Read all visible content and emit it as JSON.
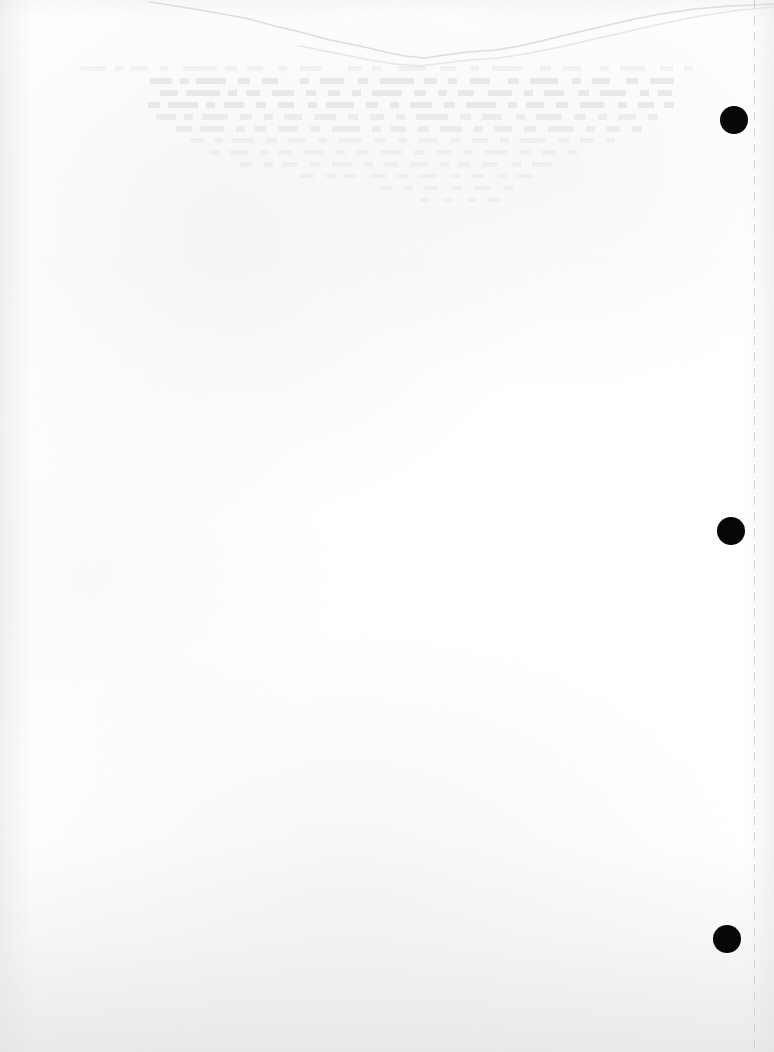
{
  "page": {
    "kind": "scanned-document-page",
    "width": 774,
    "height": 1052,
    "background_color": "#ffffff",
    "content_text": "",
    "note": "Near-blank scanned sheet: no legible printed text."
  },
  "artifacts": {
    "crease": {
      "name": "top-fold-crease",
      "color": "#d9dbdd",
      "description": "Faint irregular wavy line crossing the upper edge of the sheet",
      "path": "M 150 2 L 200 10 L 245 18 L 275 26 L 300 32 L 330 40 L 360 46 L 385 52 L 405 56 L 425 58 L 445 55 L 468 52 L 495 50 L 520 46 L 545 40 L 570 34 L 600 27 L 630 20 L 660 14 L 695 9 L 730 6 L 774 4",
      "path_shadow": "M 300 46 L 340 54 L 370 60 L 395 64 L 420 66 L 445 63 L 470 60 L 500 58 L 530 53 L 560 47 L 595 39 L 630 31 L 665 23 L 700 16 L 740 10 L 774 7"
    },
    "ghost_text": {
      "name": "bleed-through-ghost-text",
      "color": "#8c9298",
      "legible": false,
      "description": "Illegible mirrored bleed-through of text printed on the reverse side, visible in the upper third"
    },
    "guide_line": {
      "name": "right-margin-dashed-line",
      "color": "#cdd0d3",
      "x": 754,
      "style": "dashed"
    }
  },
  "registration_dots": {
    "name": "registration-dots",
    "color": "#070707",
    "count": 3,
    "items": [
      {
        "label": "dot-1",
        "cx": 734,
        "cy": 120,
        "d": 28
      },
      {
        "label": "dot-2",
        "cx": 731,
        "cy": 531,
        "d": 28
      },
      {
        "label": "dot-3",
        "cx": 727,
        "cy": 939,
        "d": 28
      }
    ]
  },
  "ghost_rows": [
    {
      "top": 66,
      "segs": [
        [
          80,
          26
        ],
        [
          115,
          9
        ],
        [
          130,
          18
        ],
        [
          160,
          8
        ],
        [
          183,
          34
        ],
        [
          225,
          12
        ],
        [
          247,
          16
        ],
        [
          278,
          9
        ],
        [
          300,
          22
        ],
        [
          348,
          14
        ],
        [
          372,
          10
        ],
        [
          398,
          28
        ],
        [
          440,
          16
        ],
        [
          470,
          9
        ],
        [
          492,
          30
        ],
        [
          540,
          11
        ],
        [
          562,
          20
        ],
        [
          600,
          9
        ],
        [
          620,
          26
        ],
        [
          660,
          13
        ],
        [
          684,
          9
        ]
      ],
      "h": 5,
      "cls": "l3"
    },
    {
      "top": 78,
      "segs": [
        [
          150,
          22
        ],
        [
          180,
          9
        ],
        [
          196,
          30
        ],
        [
          238,
          12
        ],
        [
          262,
          16
        ],
        [
          300,
          9
        ],
        [
          320,
          24
        ],
        [
          358,
          10
        ],
        [
          380,
          34
        ],
        [
          424,
          13
        ],
        [
          448,
          9
        ],
        [
          470,
          20
        ],
        [
          508,
          11
        ],
        [
          530,
          28
        ],
        [
          572,
          9
        ],
        [
          592,
          18
        ],
        [
          626,
          12
        ],
        [
          650,
          24
        ]
      ],
      "h": 6,
      "cls": ""
    },
    {
      "top": 90,
      "segs": [
        [
          160,
          18
        ],
        [
          186,
          34
        ],
        [
          228,
          9
        ],
        [
          246,
          14
        ],
        [
          272,
          22
        ],
        [
          306,
          10
        ],
        [
          328,
          12
        ],
        [
          352,
          9
        ],
        [
          372,
          30
        ],
        [
          414,
          12
        ],
        [
          438,
          9
        ],
        [
          458,
          16
        ],
        [
          488,
          24
        ],
        [
          524,
          9
        ],
        [
          544,
          20
        ],
        [
          578,
          11
        ],
        [
          600,
          26
        ],
        [
          640,
          9
        ],
        [
          658,
          14
        ]
      ],
      "h": 6,
      "cls": ""
    },
    {
      "top": 102,
      "segs": [
        [
          148,
          12
        ],
        [
          168,
          30
        ],
        [
          206,
          9
        ],
        [
          224,
          20
        ],
        [
          256,
          10
        ],
        [
          278,
          16
        ],
        [
          308,
          9
        ],
        [
          326,
          28
        ],
        [
          366,
          12
        ],
        [
          390,
          9
        ],
        [
          410,
          22
        ],
        [
          444,
          11
        ],
        [
          466,
          30
        ],
        [
          508,
          9
        ],
        [
          526,
          18
        ],
        [
          556,
          12
        ],
        [
          580,
          24
        ],
        [
          618,
          9
        ],
        [
          638,
          16
        ],
        [
          664,
          10
        ]
      ],
      "h": 6,
      "cls": ""
    },
    {
      "top": 114,
      "segs": [
        [
          156,
          20
        ],
        [
          184,
          9
        ],
        [
          202,
          26
        ],
        [
          240,
          12
        ],
        [
          264,
          9
        ],
        [
          284,
          18
        ],
        [
          314,
          22
        ],
        [
          348,
          10
        ],
        [
          370,
          14
        ],
        [
          396,
          9
        ],
        [
          416,
          32
        ],
        [
          460,
          11
        ],
        [
          482,
          20
        ],
        [
          516,
          9
        ],
        [
          536,
          26
        ],
        [
          574,
          12
        ],
        [
          598,
          9
        ],
        [
          618,
          18
        ],
        [
          648,
          10
        ]
      ],
      "h": 6,
      "cls": "l2"
    },
    {
      "top": 126,
      "segs": [
        [
          176,
          16
        ],
        [
          200,
          24
        ],
        [
          236,
          9
        ],
        [
          254,
          12
        ],
        [
          278,
          20
        ],
        [
          310,
          10
        ],
        [
          332,
          28
        ],
        [
          372,
          9
        ],
        [
          390,
          16
        ],
        [
          418,
          11
        ],
        [
          440,
          22
        ],
        [
          474,
          9
        ],
        [
          494,
          18
        ],
        [
          524,
          12
        ],
        [
          548,
          26
        ],
        [
          586,
          9
        ],
        [
          606,
          14
        ],
        [
          632,
          10
        ]
      ],
      "h": 6,
      "cls": "l2"
    },
    {
      "top": 138,
      "segs": [
        [
          190,
          14
        ],
        [
          214,
          9
        ],
        [
          232,
          22
        ],
        [
          266,
          11
        ],
        [
          288,
          18
        ],
        [
          318,
          9
        ],
        [
          338,
          24
        ],
        [
          374,
          12
        ],
        [
          398,
          9
        ],
        [
          418,
          20
        ],
        [
          450,
          10
        ],
        [
          472,
          16
        ],
        [
          500,
          9
        ],
        [
          520,
          26
        ],
        [
          558,
          11
        ],
        [
          580,
          14
        ],
        [
          606,
          9
        ]
      ],
      "h": 5,
      "cls": "l3"
    },
    {
      "top": 150,
      "segs": [
        [
          210,
          10
        ],
        [
          230,
          18
        ],
        [
          260,
          9
        ],
        [
          278,
          14
        ],
        [
          304,
          20
        ],
        [
          336,
          9
        ],
        [
          356,
          12
        ],
        [
          380,
          22
        ],
        [
          414,
          10
        ],
        [
          436,
          16
        ],
        [
          464,
          9
        ],
        [
          484,
          24
        ],
        [
          520,
          11
        ],
        [
          542,
          14
        ],
        [
          568,
          9
        ]
      ],
      "h": 5,
      "cls": "l3"
    },
    {
      "top": 162,
      "segs": [
        [
          240,
          12
        ],
        [
          264,
          9
        ],
        [
          282,
          16
        ],
        [
          310,
          10
        ],
        [
          332,
          20
        ],
        [
          364,
          9
        ],
        [
          384,
          14
        ],
        [
          410,
          18
        ],
        [
          440,
          9
        ],
        [
          458,
          12
        ],
        [
          482,
          16
        ],
        [
          512,
          9
        ],
        [
          532,
          20
        ]
      ],
      "h": 5,
      "cls": "l3"
    },
    {
      "top": 174,
      "segs": [
        [
          300,
          14
        ],
        [
          326,
          9
        ],
        [
          344,
          12
        ],
        [
          370,
          16
        ],
        [
          398,
          9
        ],
        [
          418,
          20
        ],
        [
          450,
          10
        ],
        [
          472,
          12
        ],
        [
          498,
          9
        ],
        [
          518,
          16
        ]
      ],
      "h": 4,
      "cls": "l3"
    },
    {
      "top": 186,
      "segs": [
        [
          380,
          12
        ],
        [
          404,
          9
        ],
        [
          424,
          14
        ],
        [
          452,
          10
        ],
        [
          474,
          16
        ],
        [
          504,
          9
        ]
      ],
      "h": 4,
      "cls": "l3"
    },
    {
      "top": 198,
      "segs": [
        [
          420,
          10
        ],
        [
          442,
          12
        ],
        [
          468,
          9
        ],
        [
          488,
          14
        ]
      ],
      "h": 4,
      "cls": "l3"
    }
  ]
}
